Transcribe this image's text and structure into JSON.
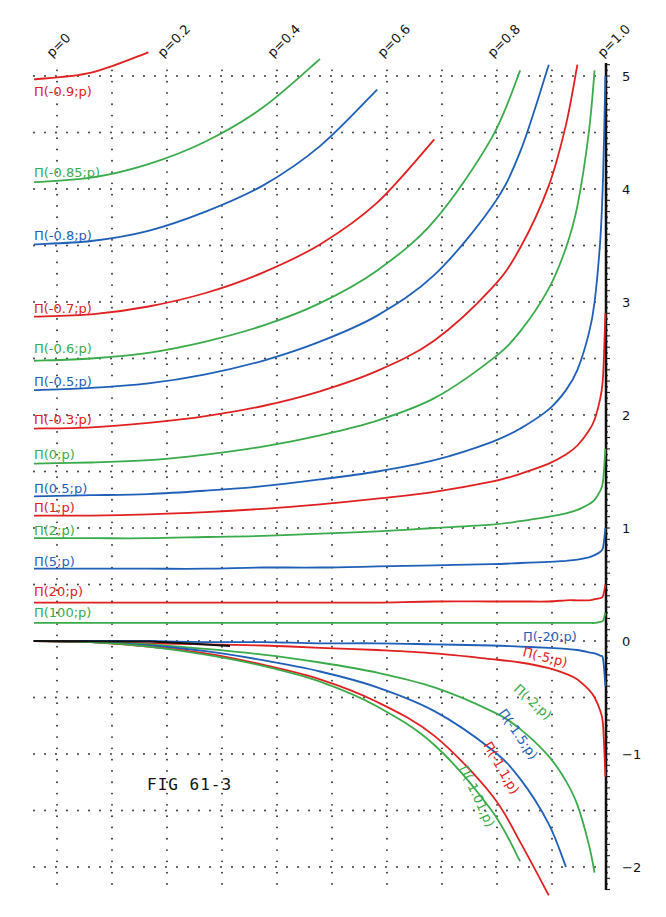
{
  "figure": {
    "title": "FIG 61-3",
    "colors": {
      "red": "#e02020",
      "green": "#3aaa4a",
      "blue": "#1f5fb8",
      "axis": "#111111",
      "grid": "#222222"
    }
  },
  "chart_data": {
    "type": "line",
    "title": "FIG 61-3",
    "xlabel": "p",
    "ylabel": "",
    "xlim": [
      0,
      1.0
    ],
    "ylim": [
      -2.2,
      5.1
    ],
    "grid": true,
    "grid_style": "dotted",
    "x_tick_labels": [
      "p=0",
      "p=0.2",
      "p=0.4",
      "p=0.6",
      "p=0.8",
      "p=1.0"
    ],
    "x_ticks": [
      0,
      0.2,
      0.4,
      0.6,
      0.8,
      1.0
    ],
    "y_tick_labels": [
      "5",
      "4",
      "3",
      "2",
      "1",
      "0",
      "-1",
      "-2"
    ],
    "y_ticks": [
      5,
      4,
      3,
      2,
      1,
      0,
      -1,
      -2
    ],
    "x": [
      0,
      0.1,
      0.2,
      0.3,
      0.4,
      0.5,
      0.6,
      0.7,
      0.8,
      0.85,
      0.9,
      0.93,
      0.95,
      0.97,
      0.98,
      0.99,
      0.995,
      0.999
    ],
    "series": [
      {
        "name": "Π(-0.9;p)",
        "label": "Π(-0.9;p)",
        "color": "red",
        "values": [
          4.97,
          5.03,
          5.21,
          null,
          null,
          null,
          null,
          null,
          null,
          null,
          null,
          null,
          null,
          null,
          null,
          null,
          null,
          null
        ]
      },
      {
        "name": "Π(-0.85;p)",
        "label": "Π(-0.85;p)",
        "color": "green",
        "values": [
          4.06,
          4.1,
          4.22,
          4.42,
          4.72,
          5.15,
          null,
          null,
          null,
          null,
          null,
          null,
          null,
          null,
          null,
          null,
          null,
          null
        ]
      },
      {
        "name": "Π(-0.8;p)",
        "label": "Π(-0.8;p)",
        "color": "blue",
        "values": [
          3.51,
          3.54,
          3.63,
          3.8,
          4.03,
          4.38,
          4.88,
          null,
          null,
          null,
          null,
          null,
          null,
          null,
          null,
          null,
          null,
          null
        ]
      },
      {
        "name": "Π(-0.7;p)",
        "label": "Π(-0.7;p)",
        "color": "red",
        "values": [
          2.87,
          2.89,
          2.96,
          3.08,
          3.26,
          3.51,
          3.88,
          4.44,
          null,
          null,
          null,
          null,
          null,
          null,
          null,
          null,
          null,
          null
        ]
      },
      {
        "name": "Π(-0.6;p)",
        "label": "Π(-0.6;p)",
        "color": "green",
        "values": [
          2.48,
          2.5,
          2.55,
          2.65,
          2.79,
          2.99,
          3.28,
          3.72,
          4.45,
          5.05,
          null,
          null,
          null,
          null,
          null,
          null,
          null,
          null
        ]
      },
      {
        "name": "Π(-0.5;p)",
        "label": "Π(-0.5;p)",
        "color": "blue",
        "values": [
          2.22,
          2.24,
          2.28,
          2.36,
          2.48,
          2.65,
          2.88,
          3.24,
          3.84,
          4.33,
          5.1,
          null,
          null,
          null,
          null,
          null,
          null,
          null
        ]
      },
      {
        "name": "Π(-0.3;p)",
        "label": "Π(-0.3;p)",
        "color": "red",
        "values": [
          1.88,
          1.89,
          1.93,
          1.99,
          2.08,
          2.21,
          2.39,
          2.66,
          3.12,
          3.48,
          4.03,
          4.57,
          5.1,
          null,
          null,
          null,
          null,
          null
        ]
      },
      {
        "name": "Π(0;p)",
        "label": "Π(0;p)",
        "color": "green",
        "values": [
          1.57,
          1.58,
          1.6,
          1.65,
          1.72,
          1.82,
          1.95,
          2.15,
          2.49,
          2.74,
          3.12,
          3.48,
          3.85,
          4.5,
          5.05,
          null,
          null,
          null
        ]
      },
      {
        "name": "Π(0.5;p)",
        "label": "Π(0.5;p)",
        "color": "blue",
        "values": [
          1.28,
          1.29,
          1.3,
          1.33,
          1.37,
          1.43,
          1.5,
          1.6,
          1.76,
          1.88,
          2.05,
          2.22,
          2.4,
          2.72,
          3.0,
          3.55,
          4.12,
          5.0
        ]
      },
      {
        "name": "Π(1;p)",
        "label": "Π(1;p)",
        "color": "red",
        "values": [
          1.11,
          1.11,
          1.12,
          1.14,
          1.17,
          1.21,
          1.26,
          1.32,
          1.41,
          1.48,
          1.57,
          1.65,
          1.73,
          1.86,
          1.96,
          2.15,
          2.35,
          2.9
        ]
      },
      {
        "name": "Π(2;p)",
        "label": "Π(2;p)",
        "color": "green",
        "values": [
          0.91,
          0.91,
          0.91,
          0.92,
          0.93,
          0.95,
          0.97,
          1.0,
          1.03,
          1.06,
          1.1,
          1.13,
          1.16,
          1.21,
          1.25,
          1.33,
          1.42,
          1.7
        ]
      },
      {
        "name": "Π(5;p)",
        "label": "Π(5;p)",
        "color": "blue",
        "values": [
          0.64,
          0.64,
          0.64,
          0.64,
          0.65,
          0.65,
          0.66,
          0.67,
          0.68,
          0.69,
          0.7,
          0.71,
          0.72,
          0.74,
          0.76,
          0.79,
          0.83,
          1.0
        ]
      },
      {
        "name": "Π(20;p)",
        "label": "Π(20;p)",
        "color": "red",
        "values": [
          0.34,
          0.34,
          0.34,
          0.34,
          0.34,
          0.34,
          0.34,
          0.35,
          0.35,
          0.35,
          0.35,
          0.36,
          0.36,
          0.36,
          0.37,
          0.38,
          0.4,
          0.5
        ]
      },
      {
        "name": "Π(100;p)",
        "label": "Π(100;p)",
        "color": "green",
        "values": [
          0.16,
          0.16,
          0.16,
          0.16,
          0.16,
          0.16,
          0.16,
          0.16,
          0.16,
          0.16,
          0.16,
          0.16,
          0.16,
          0.16,
          0.16,
          0.17,
          0.18,
          0.25
        ]
      },
      {
        "name": "Π(-20;p)",
        "label": "Π(-20;p)",
        "color": "blue",
        "values": [
          0.0,
          0.0,
          0.0,
          -0.01,
          -0.01,
          -0.02,
          -0.02,
          -0.03,
          -0.04,
          -0.05,
          -0.06,
          -0.07,
          -0.08,
          -0.1,
          -0.11,
          -0.13,
          -0.16,
          -0.4
        ]
      },
      {
        "name": "Π(-5;p)",
        "label": "Π(-5;p)",
        "color": "red",
        "values": [
          0.0,
          -0.01,
          -0.02,
          -0.03,
          -0.04,
          -0.06,
          -0.08,
          -0.11,
          -0.16,
          -0.19,
          -0.24,
          -0.29,
          -0.34,
          -0.43,
          -0.5,
          -0.62,
          -0.75,
          -1.2
        ]
      },
      {
        "name": "Π(-2;p)",
        "label": "Π(-2;p)",
        "color": "green",
        "values": [
          0.0,
          -0.01,
          -0.03,
          -0.07,
          -0.12,
          -0.19,
          -0.28,
          -0.41,
          -0.62,
          -0.78,
          -1.02,
          -1.24,
          -1.45,
          -1.8,
          -2.05,
          null,
          null,
          null
        ]
      },
      {
        "name": "Π(-1.5;p)",
        "label": "Π(-1.5;p)",
        "color": "blue",
        "values": [
          0.0,
          -0.01,
          -0.04,
          -0.09,
          -0.17,
          -0.27,
          -0.41,
          -0.62,
          -0.96,
          -1.22,
          -1.62,
          -2.0,
          null,
          null,
          null,
          null,
          null,
          null
        ]
      },
      {
        "name": "Π(-1.1;p)",
        "label": "Π(-1.1;p)",
        "color": "red",
        "values": [
          0.0,
          -0.01,
          -0.05,
          -0.11,
          -0.21,
          -0.34,
          -0.54,
          -0.84,
          -1.36,
          -1.78,
          -2.25,
          null,
          null,
          null,
          null,
          null,
          null,
          null
        ]
      },
      {
        "name": "Π(-1.01;p)",
        "label": "Π(-1.01;p)",
        "color": "green",
        "values": [
          0.0,
          -0.01,
          -0.05,
          -0.12,
          -0.22,
          -0.36,
          -0.58,
          -0.92,
          -1.5,
          -1.95,
          null,
          null,
          null,
          null,
          null,
          null,
          null,
          null
        ]
      }
    ],
    "annotations": [
      "FIG 61-3"
    ]
  },
  "labels": [
    {
      "text": "Π(-0.9;p)",
      "color": "red",
      "x": 34,
      "y": 96,
      "rot": 0
    },
    {
      "text": "Π(-0.85;p)",
      "color": "green",
      "x": 34,
      "y": 177,
      "rot": 0
    },
    {
      "text": "Π(-0.8;p)",
      "color": "blue",
      "x": 34,
      "y": 240,
      "rot": 0
    },
    {
      "text": "Π(-0.7;p)",
      "color": "red",
      "x": 34,
      "y": 313,
      "rot": 0
    },
    {
      "text": "Π(-0.6;p)",
      "color": "green",
      "x": 34,
      "y": 353,
      "rot": 0
    },
    {
      "text": "Π(-0.5;p)",
      "color": "blue",
      "x": 34,
      "y": 386,
      "rot": 0
    },
    {
      "text": "Π(-0.3;p)",
      "color": "red",
      "x": 34,
      "y": 424,
      "rot": 0
    },
    {
      "text": "Π(0;p)",
      "color": "green",
      "x": 34,
      "y": 459,
      "rot": 0
    },
    {
      "text": "Π(0.5;p)",
      "color": "blue",
      "x": 34,
      "y": 493,
      "rot": 0
    },
    {
      "text": "Π(1;p)",
      "color": "red",
      "x": 34,
      "y": 512,
      "rot": 0
    },
    {
      "text": "Π(2;p)",
      "color": "green",
      "x": 34,
      "y": 535,
      "rot": 0
    },
    {
      "text": "Π(5;p)",
      "color": "blue",
      "x": 34,
      "y": 566,
      "rot": 0
    },
    {
      "text": "Π(20;p)",
      "color": "red",
      "x": 34,
      "y": 596,
      "rot": 0
    },
    {
      "text": "Π(100;p)",
      "color": "green",
      "x": 34,
      "y": 617,
      "rot": 0
    },
    {
      "text": "Π(-20;p)",
      "color": "blue",
      "x": 523,
      "y": 641,
      "rot": 0
    },
    {
      "text": "Π(-5;p)",
      "color": "red",
      "x": 522,
      "y": 656,
      "rot": 14
    },
    {
      "text": "Π(-2;p)",
      "color": "green",
      "x": 513,
      "y": 690,
      "rot": 42
    },
    {
      "text": "Π(-1.5;p)",
      "color": "blue",
      "x": 498,
      "y": 713,
      "rot": 55
    },
    {
      "text": "Π(-1.1;p)",
      "color": "red",
      "x": 483,
      "y": 745,
      "rot": 60
    },
    {
      "text": "Π(-1.01;p)",
      "color": "green",
      "x": 459,
      "y": 768,
      "rot": 65
    }
  ],
  "x_labels": [
    {
      "text": "p=0",
      "x": 56,
      "y": 60
    },
    {
      "text": "p=0.2",
      "x": 167,
      "y": 60
    },
    {
      "text": "p=0.4",
      "x": 277,
      "y": 60
    },
    {
      "text": "p=0.6",
      "x": 387,
      "y": 60
    },
    {
      "text": "p=0.8",
      "x": 497,
      "y": 60
    },
    {
      "text": "p=1.0",
      "x": 607,
      "y": 60
    }
  ]
}
